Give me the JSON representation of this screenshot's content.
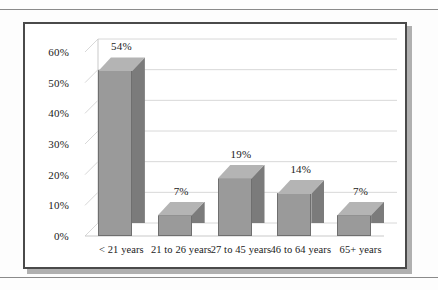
{
  "chart_data": {
    "type": "bar",
    "title": "",
    "subtitle": "",
    "xlabel": "",
    "ylabel": "",
    "categories": [
      "< 21 years",
      "21 to 26 years",
      "27 to 45 years",
      "46 to 64 years",
      "65+ years"
    ],
    "values": [
      54,
      7,
      19,
      14,
      7
    ],
    "data_labels": [
      "54%",
      "7%",
      "19%",
      "14%",
      "7%"
    ],
    "ylim": [
      0,
      60
    ],
    "ytick_values": [
      0,
      10,
      20,
      30,
      40,
      50,
      60
    ],
    "ytick_labels": [
      "0%",
      "10%",
      "20%",
      "30%",
      "40%",
      "50%",
      "60%"
    ],
    "grid": true,
    "grid_axis": "y",
    "legend": false,
    "legend_position": "none",
    "style": "3d-column",
    "series": [
      {
        "name": "Percent",
        "values": [
          54,
          7,
          19,
          14,
          7
        ]
      }
    ],
    "colors": {
      "bar_front": "#9a9a9a",
      "bar_side": "#7b7b7b",
      "bar_top": "#b4b4b4",
      "bar_outline": "#6f6f6f",
      "gridline": "#d8d8d8",
      "axis": "#c9c9c9",
      "frame_border": "#4a4a4a",
      "frame_shadow": "#b0b0b0",
      "plot_background": "#ffffff",
      "page_background": "#fdfdfd",
      "text": "#1a1a1a",
      "rule": "#8a8a8a"
    }
  }
}
